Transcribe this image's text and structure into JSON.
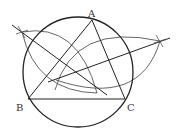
{
  "diagram": {
    "type": "geometric-construction",
    "colors": {
      "stroke": "#222222",
      "arc": "#555555",
      "label": "#333333",
      "background": "#ffffff"
    },
    "points": {
      "A": {
        "label": "A",
        "x": 92,
        "y": 20
      },
      "B": {
        "label": "B",
        "x": 28,
        "y": 99
      },
      "C": {
        "label": "C",
        "x": 125,
        "y": 99
      }
    },
    "labels": [
      {
        "text": "A",
        "x": 88,
        "y": 9
      },
      {
        "text": "B",
        "x": 16,
        "y": 103
      },
      {
        "text": "C",
        "x": 127,
        "y": 103
      }
    ],
    "circle": {
      "cx": 78,
      "cy": 72,
      "r": 55
    },
    "triangle": [
      "A",
      "B",
      "C"
    ],
    "bisector_lines": [
      {
        "name": "bisector-1",
        "x1": 12,
        "y1": 25,
        "x2": 107,
        "y2": 95
      },
      {
        "name": "bisector-2",
        "x1": 48,
        "y1": 82,
        "x2": 170,
        "y2": 38
      }
    ],
    "cross_marks": [
      {
        "x": 22,
        "y": 32
      },
      {
        "x": 160,
        "y": 41
      }
    ],
    "arcs": [
      {
        "name": "arc-left-upper",
        "d": "M 22 32 Q 78 22 97 93"
      },
      {
        "name": "arc-left-lower",
        "d": "M 22 32 Q 36 92 97 93"
      },
      {
        "name": "arc-right-upper",
        "d": "M 55 90 Q 74 22 160 41"
      },
      {
        "name": "arc-right-lower",
        "d": "M 56 80 Q 140 108 160 41"
      }
    ]
  }
}
